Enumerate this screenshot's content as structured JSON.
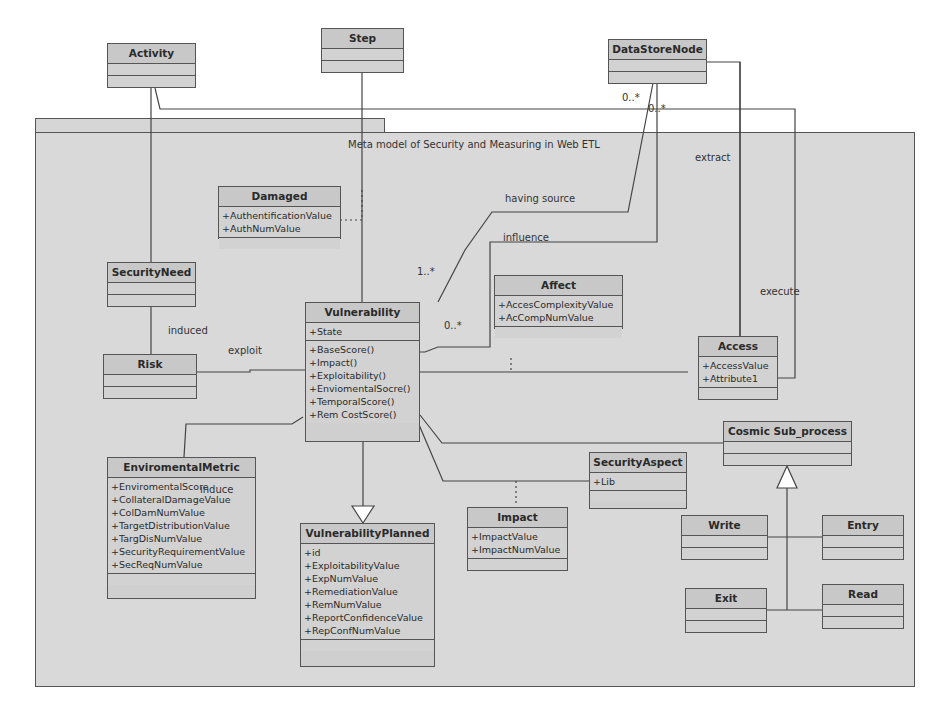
{
  "package": {
    "title": "Meta model of Security and Measuring in Web ETL"
  },
  "classes": {
    "activity": {
      "name": "Activity",
      "attributes": [],
      "operations": []
    },
    "step": {
      "name": "Step",
      "attributes": [],
      "operations": []
    },
    "datastorenode": {
      "name": "DataStoreNode",
      "attributes": [],
      "operations": []
    },
    "damaged": {
      "name": "Damaged",
      "attributes": [
        "+AuthentificationValue",
        "+AuthNumValue"
      ],
      "operations": []
    },
    "securityneed": {
      "name": "SecurityNeed",
      "attributes": [],
      "operations": []
    },
    "risk": {
      "name": "Risk",
      "attributes": [],
      "operations": []
    },
    "vulnerability": {
      "name": "Vulnerability",
      "attributes": [
        "+State"
      ],
      "operations": [
        "+BaseScore()",
        "+Impact()",
        "+Exploitability()",
        "+EnviomentalSocre()",
        "+TemporalScore()",
        "+Rem CostScore()"
      ]
    },
    "affect": {
      "name": "Affect",
      "attributes": [
        "+AccesComplexityValue",
        "+AcCompNumValue"
      ],
      "operations": []
    },
    "access": {
      "name": "Access",
      "attributes": [
        "+AccessValue",
        "+Attribute1"
      ],
      "operations": []
    },
    "enviromentalmetric": {
      "name": "EnviromentalMetric",
      "attributes": [
        "+EnviromentalScore",
        "+CollateralDamageValue",
        "+ColDamNumValue",
        "+TargetDistributionValue",
        "+TargDisNumValue",
        "+SecurityRequirementValue",
        "+SecReqNumValue"
      ],
      "operations": []
    },
    "vulnerabilityplanned": {
      "name": "VulnerabilityPlanned",
      "attributes": [
        "+id",
        "+ExploitabilityValue",
        "+ExpNumValue",
        "+RemediationValue",
        "+RemNumValue",
        "+ReportConfidenceValue",
        "+RepConfNumValue"
      ],
      "operations": []
    },
    "impact": {
      "name": "Impact",
      "attributes": [
        "+ImpactValue",
        "+ImpactNumValue"
      ],
      "operations": []
    },
    "securityaspect": {
      "name": "SecurityAspect",
      "attributes": [
        "+Lib"
      ],
      "operations": []
    },
    "cosmicsubprocess": {
      "name": "Cosmic Sub_process",
      "attributes": [],
      "operations": []
    },
    "write": {
      "name": "Write",
      "attributes": [],
      "operations": []
    },
    "entry": {
      "name": "Entry",
      "attributes": [],
      "operations": []
    },
    "exit": {
      "name": "Exit",
      "attributes": [],
      "operations": []
    },
    "read": {
      "name": "Read",
      "attributes": [],
      "operations": []
    }
  },
  "labels": {
    "mult_datastore_1": "0..*",
    "mult_datastore_2": "0..*",
    "extract": "extract",
    "having_source": "having source",
    "influence": "influence",
    "mult_vuln_1": "1..*",
    "mult_vuln_2": "0..*",
    "execute": "execute",
    "induced": "induced",
    "exploit": "exploit",
    "induce": "induce"
  }
}
